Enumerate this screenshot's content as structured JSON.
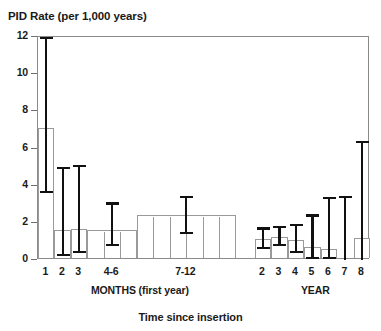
{
  "chart_data": {
    "type": "bar",
    "title": "",
    "ylabel": "PID Rate (per 1,000 years)",
    "xlabel": "Time since insertion",
    "ylim": [
      0,
      12
    ],
    "yticks": [
      0,
      2,
      4,
      6,
      8,
      10,
      12
    ],
    "ytick_labels": [
      "0",
      "2",
      "4",
      "6",
      "8",
      "10",
      "12"
    ],
    "grid": false,
    "legend": false,
    "categories": [
      "1",
      "2",
      "3",
      "4-6",
      "7-12",
      "2",
      "3",
      "4",
      "5",
      "6",
      "7",
      "8"
    ],
    "values": [
      7.0,
      1.5,
      1.55,
      1.5,
      2.3,
      1.05,
      1.15,
      0.95,
      0.6,
      0.5,
      0.0,
      1.1
    ],
    "error_low": [
      3.6,
      0.2,
      0.35,
      0.75,
      1.4,
      0.6,
      0.75,
      0.35,
      0.05,
      0.05,
      0.0,
      0.0
    ],
    "error_high": [
      12.0,
      5.0,
      5.1,
      3.1,
      3.45,
      1.75,
      1.85,
      1.95,
      2.45,
      3.4,
      3.45,
      6.4
    ],
    "series": [
      {
        "name": "PID rate",
        "points": [
          {
            "label": "1",
            "group": "MONTHS (first year)",
            "value": 7.0,
            "ci_low": 3.6,
            "ci_high": 12.0,
            "span": 1
          },
          {
            "label": "2",
            "group": "MONTHS (first year)",
            "value": 1.5,
            "ci_low": 0.2,
            "ci_high": 5.0,
            "span": 1
          },
          {
            "label": "3",
            "group": "MONTHS (first year)",
            "value": 1.55,
            "ci_low": 0.35,
            "ci_high": 5.1,
            "span": 1
          },
          {
            "label": "4-6",
            "group": "MONTHS (first year)",
            "value": 1.5,
            "ci_low": 0.75,
            "ci_high": 3.1,
            "span": 3
          },
          {
            "label": "7-12",
            "group": "MONTHS (first year)",
            "value": 2.3,
            "ci_low": 1.4,
            "ci_high": 3.45,
            "span": 6
          },
          {
            "label": "2",
            "group": "YEAR",
            "value": 1.05,
            "ci_low": 0.6,
            "ci_high": 1.75,
            "span": 1
          },
          {
            "label": "3",
            "group": "YEAR",
            "value": 1.15,
            "ci_low": 0.75,
            "ci_high": 1.85,
            "span": 1
          },
          {
            "label": "4",
            "group": "YEAR",
            "value": 0.95,
            "ci_low": 0.35,
            "ci_high": 1.95,
            "span": 1
          },
          {
            "label": "5",
            "group": "YEAR",
            "value": 0.6,
            "ci_low": 0.05,
            "ci_high": 2.45,
            "span": 1
          },
          {
            "label": "6",
            "group": "YEAR",
            "value": 0.5,
            "ci_low": 0.05,
            "ci_high": 3.4,
            "span": 1
          },
          {
            "label": "7",
            "group": "YEAR",
            "value": 0.0,
            "ci_low": 0.0,
            "ci_high": 3.45,
            "span": 1
          },
          {
            "label": "8",
            "group": "YEAR",
            "value": 1.1,
            "ci_low": 0.0,
            "ci_high": 6.4,
            "span": 1
          }
        ]
      }
    ],
    "groups": [
      {
        "label": "MONTHS (first year)",
        "start": 0,
        "end": 11
      },
      {
        "label": "YEAR",
        "start": 12,
        "end": 18
      }
    ],
    "colors": {
      "bar_fill": "#ffffff",
      "bar_stroke": "#9a9a9a",
      "error_bar": "#111111",
      "axis": "#8a8a8a",
      "text": "#1a1a1a"
    }
  }
}
